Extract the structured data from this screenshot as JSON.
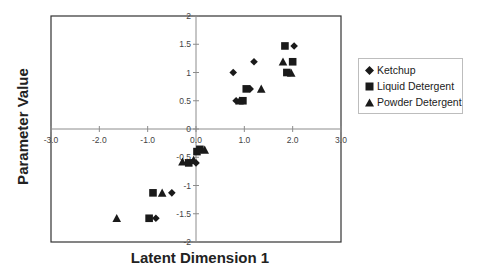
{
  "chart_data": {
    "type": "scatter",
    "title": "",
    "xlabel": "Latent Dimension 1",
    "ylabel": "Parameter Value",
    "xlim": [
      -3,
      3
    ],
    "ylim": [
      -2,
      2
    ],
    "x_ticks": [
      "-3.0",
      "-2.0",
      "-1.0",
      "0.0",
      "1.0",
      "2.0",
      "3.0"
    ],
    "y_ticks": [
      "-2",
      "-1.5",
      "-1",
      "-0.5",
      "0",
      "0.5",
      "1",
      "1.5",
      "2"
    ],
    "grid": false,
    "legend_position": "right",
    "series": [
      {
        "name": "Ketchup",
        "marker": "diamond",
        "points": [
          [
            2.03,
            1.47
          ],
          [
            1.2,
            1.19
          ],
          [
            0.77,
            1.0
          ],
          [
            1.12,
            0.71
          ],
          [
            0.83,
            0.5
          ],
          [
            0.0,
            -0.6
          ],
          [
            -0.5,
            -1.13
          ],
          [
            -0.83,
            -1.58
          ],
          [
            0.05,
            -0.38
          ]
        ]
      },
      {
        "name": "Liquid Detergent",
        "marker": "square",
        "points": [
          [
            1.84,
            1.47
          ],
          [
            2.0,
            1.19
          ],
          [
            1.88,
            1.0
          ],
          [
            1.04,
            0.71
          ],
          [
            0.97,
            0.5
          ],
          [
            0.02,
            -0.4
          ],
          [
            -0.15,
            -0.6
          ],
          [
            -0.89,
            -1.13
          ],
          [
            -0.97,
            -1.58
          ],
          [
            0.08,
            -0.36
          ]
        ]
      },
      {
        "name": "Powder Detergent",
        "marker": "triangle",
        "points": [
          [
            1.8,
            1.19
          ],
          [
            1.97,
            0.99
          ],
          [
            1.35,
            0.71
          ],
          [
            0.9,
            0.5
          ],
          [
            0.18,
            -0.37
          ],
          [
            -0.28,
            -0.58
          ],
          [
            -0.7,
            -1.13
          ],
          [
            -1.64,
            -1.58
          ],
          [
            -0.05,
            -0.55
          ]
        ]
      }
    ]
  },
  "axes": {
    "xlabel": "Latent Dimension 1",
    "ylabel": "Parameter Value"
  },
  "legend": {
    "items": [
      {
        "label": "Ketchup",
        "marker": "diamond"
      },
      {
        "label": "Liquid Detergent",
        "marker": "square"
      },
      {
        "label": "Powder Detergent",
        "marker": "triangle"
      }
    ]
  },
  "colors": {
    "marker": "#1a1a1a",
    "axis": "#8c8c8c",
    "frame": "#333333"
  }
}
